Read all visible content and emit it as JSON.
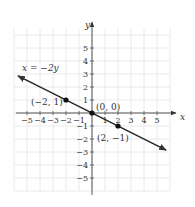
{
  "chart_data": {
    "type": "line",
    "title": "",
    "xlabel": "x",
    "ylabel": "y",
    "xlim": [
      -6,
      6
    ],
    "ylim": [
      -6,
      6.5
    ],
    "grid": true,
    "x_ticks": [
      -5,
      -4,
      -3,
      -2,
      -1,
      1,
      2,
      3,
      4,
      5
    ],
    "y_ticks": [
      -5,
      -4,
      -3,
      -2,
      -1,
      1,
      2,
      3,
      4,
      5
    ],
    "series": [
      {
        "name": "x = -2y",
        "equation": "x = −2y",
        "line_from": [
          -5.7,
          2.85
        ],
        "line_to": [
          5.7,
          -2.85
        ],
        "arrows": "both"
      }
    ],
    "points": [
      {
        "x": -2,
        "y": 1,
        "label": "(−2, 1)"
      },
      {
        "x": 0,
        "y": 0,
        "label": "(0, 0)"
      },
      {
        "x": 2,
        "y": -1,
        "label": "(2, −1)"
      }
    ],
    "annotations": [
      {
        "text": "x = −2y",
        "near": [
          -5,
          3
        ]
      }
    ]
  },
  "labels": {
    "x_axis": "x",
    "y_axis": "y",
    "equation": "x = −2y",
    "p1": "(−2, 1)",
    "p2": "(0, 0)",
    "p3": "(2, −1)"
  }
}
